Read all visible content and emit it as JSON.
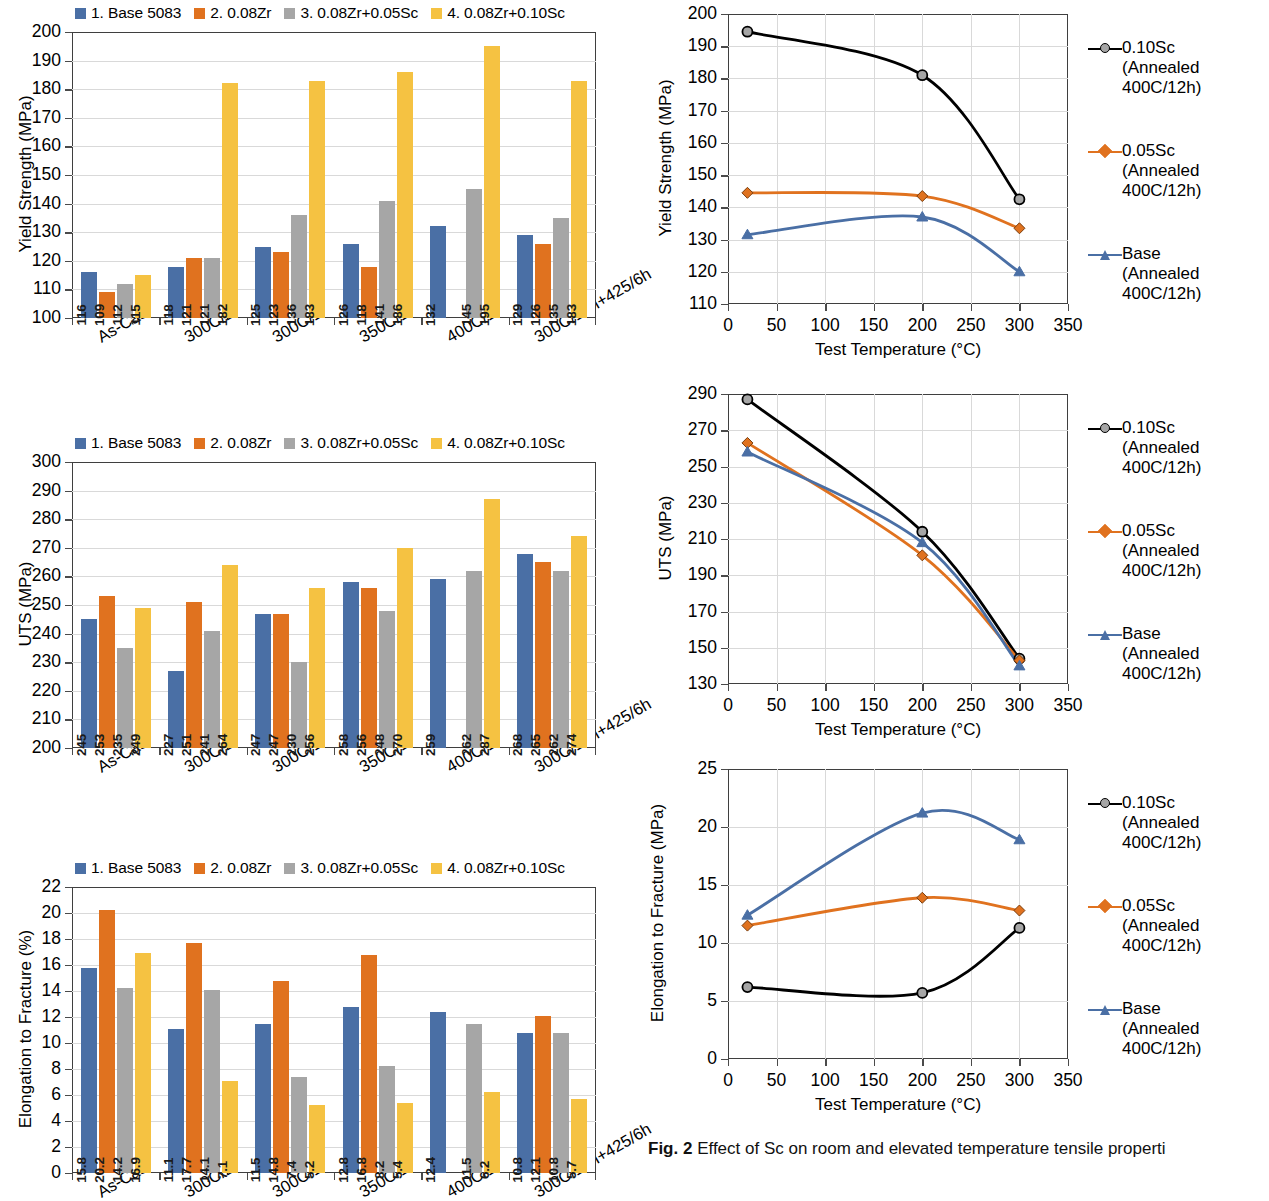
{
  "colors": {
    "series1": "#4a6fa5",
    "series2": "#e0721f",
    "series3": "#a6a6a6",
    "series4": "#f5c242",
    "black": "#000000",
    "orange_line": "#e0721f",
    "blue_line": "#4a6fa5",
    "grid": "#d9d9d9",
    "axis": "#3f3f3f"
  },
  "bar_legend": [
    {
      "label": "1. Base 5083",
      "color": "#4a6fa5"
    },
    {
      "label": "2. 0.08Zr",
      "color": "#e0721f"
    },
    {
      "label": "3. 0.08Zr+0.05Sc",
      "color": "#a6a6a6"
    },
    {
      "label": "4. 0.08Zr+0.10Sc",
      "color": "#f5c242"
    }
  ],
  "line_legend": [
    {
      "label_line1": "0.10Sc",
      "label_line2": "(Annealed",
      "label_line3": "400C/12h)",
      "color": "#000000",
      "marker": "circle"
    },
    {
      "label_line1": "0.05Sc",
      "label_line2": "(Annealed",
      "label_line3": "400C/12h)",
      "color": "#e0721f",
      "marker": "diamond"
    },
    {
      "label_line1": "Base",
      "label_line2": "(Annealed",
      "label_line3": "400C/12h)",
      "color": "#4a6fa5",
      "marker": "triangle"
    }
  ],
  "chart_data": [
    {
      "id": "bar-yield-strength",
      "type": "bar",
      "title": "",
      "xlabel": "",
      "ylabel": "Yield Strength (MPa)",
      "ylim": [
        100,
        200
      ],
      "ytick_step": 10,
      "yticks": [
        100,
        110,
        120,
        130,
        140,
        150,
        160,
        170,
        180,
        190,
        200
      ],
      "grid": true,
      "legend_position": "top",
      "categories": [
        "As-Cast",
        "300C/2h",
        "300C/16h",
        "350C/16h",
        "400C/12h",
        "300C/16h+425/6h"
      ],
      "series": [
        {
          "name": "1. Base 5083",
          "color": "#4a6fa5",
          "values": [
            116,
            118,
            125,
            126,
            132,
            129
          ]
        },
        {
          "name": "2. 0.08Zr",
          "color": "#e0721f",
          "values": [
            109,
            121,
            123,
            118,
            null,
            126
          ]
        },
        {
          "name": "3. 0.08Zr+0.05Sc",
          "color": "#a6a6a6",
          "values": [
            112,
            121,
            136,
            141,
            145,
            135
          ]
        },
        {
          "name": "4. 0.08Zr+0.10Sc",
          "color": "#f5c242",
          "values": [
            115,
            182,
            183,
            186,
            195,
            183
          ]
        }
      ]
    },
    {
      "id": "bar-uts",
      "type": "bar",
      "title": "",
      "xlabel": "",
      "ylabel": "UTS (MPa)",
      "ylim": [
        200,
        300
      ],
      "ytick_step": 10,
      "yticks": [
        200,
        210,
        220,
        230,
        240,
        250,
        260,
        270,
        280,
        290,
        300
      ],
      "grid": true,
      "legend_position": "top",
      "categories": [
        "As-Cast",
        "300C/2h",
        "300C/16h",
        "350C/16h",
        "400C/12h",
        "300C/16h+425/6h"
      ],
      "series": [
        {
          "name": "1. Base 5083",
          "color": "#4a6fa5",
          "values": [
            245,
            227,
            247,
            258,
            259,
            268
          ]
        },
        {
          "name": "2. 0.08Zr",
          "color": "#e0721f",
          "values": [
            253,
            251,
            247,
            256,
            null,
            265
          ]
        },
        {
          "name": "3. 0.08Zr+0.05Sc",
          "color": "#a6a6a6",
          "values": [
            235,
            241,
            230,
            248,
            262,
            262
          ]
        },
        {
          "name": "4. 0.08Zr+0.10Sc",
          "color": "#f5c242",
          "values": [
            249,
            264,
            256,
            270,
            287,
            274
          ]
        }
      ]
    },
    {
      "id": "bar-elongation",
      "type": "bar",
      "title": "",
      "xlabel": "",
      "ylabel": "Elongation to Fracture (%)",
      "ylim": [
        0,
        22
      ],
      "ytick_step": 2,
      "yticks": [
        0,
        2,
        4,
        6,
        8,
        10,
        12,
        14,
        16,
        18,
        20,
        22
      ],
      "grid": true,
      "legend_position": "top",
      "note": "bottom of this chart is cropped by the screenshot edge",
      "categories": [
        "As-Cast",
        "300C/2h",
        "300C/16h",
        "350C/16h",
        "400C/12h",
        "300C/16h+425/6h"
      ],
      "series": [
        {
          "name": "1. Base 5083",
          "color": "#4a6fa5",
          "values": [
            15.8,
            11.1,
            11.5,
            12.8,
            12.4,
            10.8
          ]
        },
        {
          "name": "2. 0.08Zr",
          "color": "#e0721f",
          "values": [
            20.2,
            17.7,
            14.8,
            16.8,
            null,
            12.1
          ]
        },
        {
          "name": "3. 0.08Zr+0.05Sc",
          "color": "#a6a6a6",
          "values": [
            14.2,
            14.1,
            7.4,
            8.2,
            11.5,
            10.8
          ]
        },
        {
          "name": "4. 0.08Zr+0.10Sc",
          "color": "#f5c242",
          "values": [
            16.9,
            7.1,
            5.2,
            5.4,
            6.2,
            5.7
          ]
        }
      ]
    },
    {
      "id": "line-yield-strength",
      "type": "line",
      "title": "",
      "xlabel": "Test Temperature (°C)",
      "ylabel": "Yield Strength (MPa)",
      "xlim": [
        0,
        350
      ],
      "ylim": [
        110,
        200
      ],
      "xticks": [
        0,
        50,
        100,
        150,
        200,
        250,
        300,
        350
      ],
      "yticks": [
        110,
        120,
        130,
        140,
        150,
        160,
        170,
        180,
        190,
        200
      ],
      "grid": true,
      "legend_position": "right",
      "series": [
        {
          "name": "0.10Sc (Annealed 400C/12h)",
          "color": "#000000",
          "marker": "circle",
          "x": [
            20,
            200,
            300
          ],
          "y": [
            194.5,
            181,
            142.5
          ]
        },
        {
          "name": "0.05Sc (Annealed 400C/12h)",
          "color": "#e0721f",
          "marker": "diamond",
          "x": [
            20,
            200,
            300
          ],
          "y": [
            144.5,
            143.5,
            133.5
          ]
        },
        {
          "name": "Base (Annealed 400C/12h)",
          "color": "#4a6fa5",
          "marker": "triangle",
          "x": [
            20,
            200,
            300
          ],
          "y": [
            131.5,
            137,
            120
          ]
        }
      ]
    },
    {
      "id": "line-uts",
      "type": "line",
      "title": "",
      "xlabel": "Test Temperature (°C)",
      "ylabel": "UTS (MPa)",
      "xlim": [
        0,
        350
      ],
      "ylim": [
        130,
        290
      ],
      "xticks": [
        0,
        50,
        100,
        150,
        200,
        250,
        300,
        350
      ],
      "yticks": [
        130,
        150,
        170,
        190,
        210,
        230,
        250,
        270,
        290
      ],
      "grid": true,
      "legend_position": "right",
      "series": [
        {
          "name": "0.10Sc (Annealed 400C/12h)",
          "color": "#000000",
          "marker": "circle",
          "x": [
            20,
            200,
            300
          ],
          "y": [
            287,
            214,
            144
          ]
        },
        {
          "name": "0.05Sc (Annealed 400C/12h)",
          "color": "#e0721f",
          "marker": "diamond",
          "x": [
            20,
            200,
            300
          ],
          "y": [
            263,
            201,
            143
          ]
        },
        {
          "name": "Base (Annealed 400C/12h)",
          "color": "#4a6fa5",
          "marker": "triangle",
          "x": [
            20,
            200,
            300
          ],
          "y": [
            258,
            208,
            140
          ]
        }
      ]
    },
    {
      "id": "line-elongation",
      "type": "line",
      "title": "",
      "xlabel": "Test Temperature (°C)",
      "ylabel": "Elongation to Fracture (MPa)",
      "xlim": [
        0,
        350
      ],
      "ylim": [
        0,
        25
      ],
      "xticks": [
        0,
        50,
        100,
        150,
        200,
        250,
        300,
        350
      ],
      "yticks": [
        0,
        5,
        10,
        15,
        20,
        25
      ],
      "grid": true,
      "legend_position": "right",
      "series": [
        {
          "name": "0.10Sc (Annealed 400C/12h)",
          "color": "#000000",
          "marker": "circle",
          "x": [
            20,
            200,
            300
          ],
          "y": [
            6.2,
            5.7,
            11.3
          ]
        },
        {
          "name": "0.05Sc (Annealed 400C/12h)",
          "color": "#e0721f",
          "marker": "diamond",
          "x": [
            20,
            200,
            300
          ],
          "y": [
            11.5,
            13.9,
            12.8
          ]
        },
        {
          "name": "Base (Annealed 400C/12h)",
          "color": "#4a6fa5",
          "marker": "triangle",
          "x": [
            20,
            200,
            300
          ],
          "y": [
            12.4,
            21.2,
            18.9
          ]
        }
      ]
    }
  ],
  "caption": {
    "figure_number": "Fig. 2",
    "text": "Effect of Sc on room and elevated temperature tensile properti"
  }
}
